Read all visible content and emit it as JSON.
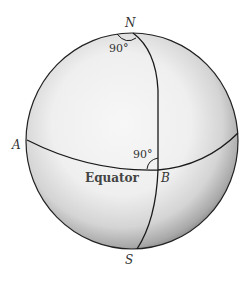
{
  "diagram": {
    "type": "sphere-geodesic-triangle",
    "labels": {
      "north": "N",
      "south": "S",
      "point_a": "A",
      "point_b": "B",
      "equator": "Equator",
      "angle_north": "90°",
      "angle_b": "90°"
    },
    "colors": {
      "sphere_light": "#f4f4f4",
      "sphere_shadow": "#9a9a9a",
      "line": "#1a1a1a",
      "text": "#333333"
    }
  }
}
